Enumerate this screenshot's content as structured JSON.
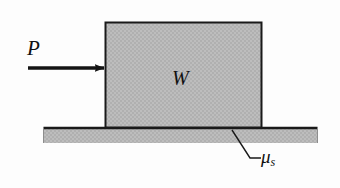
{
  "figure": {
    "type": "free-body-diagram",
    "background_color": "#fdfdfd",
    "outline_color": "#1a1a1a",
    "fill_color": "#b8b8b8",
    "labels": {
      "applied_force": "P",
      "weight": "W",
      "friction_coefficient_symbol": "μ",
      "friction_coefficient_subscript": "s"
    },
    "elements": {
      "block": {
        "name": "block",
        "x": 105,
        "y": 22,
        "width": 157,
        "height": 105
      },
      "ground": {
        "name": "ground-surface",
        "x": 43,
        "y": 127,
        "width": 275,
        "height": 16
      },
      "force_arrow": {
        "name": "force-arrow-P",
        "x1": 28,
        "y1": 68,
        "x2": 105,
        "y2": 68,
        "direction": "right"
      },
      "leader_line": {
        "name": "leader-line-mu",
        "points": "232,131 250,158 261,158"
      }
    }
  }
}
